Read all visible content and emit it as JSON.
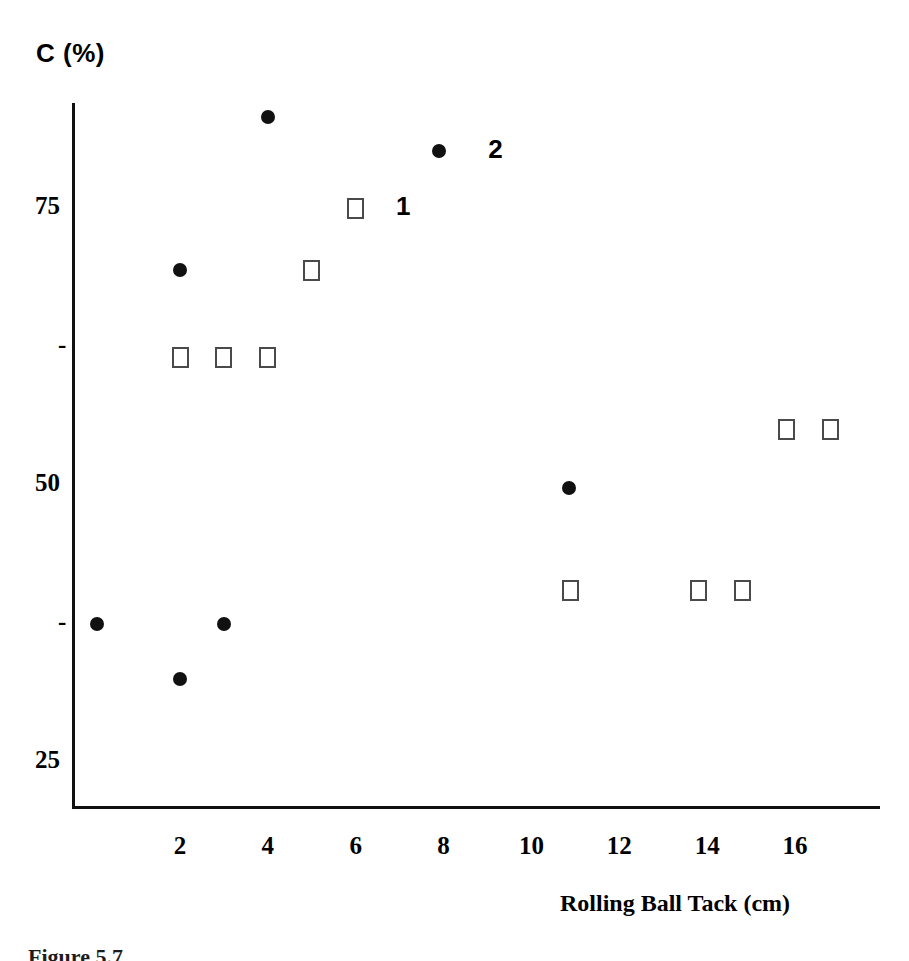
{
  "chart_data": {
    "type": "scatter",
    "title": "",
    "xlabel": "Rolling Ball Tack (cm)",
    "ylabel": "C (%)",
    "xlim": [
      0,
      18.4
    ],
    "ylim": [
      22.5,
      86
    ],
    "grid": false,
    "legend_position": "inline-annotation",
    "xticks": [
      2,
      4,
      6,
      8,
      10,
      12,
      14,
      16
    ],
    "xtick_labels": [
      "2",
      "4",
      "6",
      "8",
      "10",
      "12",
      "14",
      "16"
    ],
    "yticks": [
      75,
      62.5,
      50,
      37.5,
      25
    ],
    "ytick_labels": [
      "75",
      "-",
      "50",
      "-",
      "25"
    ],
    "annotations": [
      {
        "text": "1",
        "x": 7.1,
        "y": 75.0,
        "series": "Series 1"
      },
      {
        "text": "2",
        "x": 9.2,
        "y": 80.1,
        "series": "Series 2"
      }
    ],
    "series": [
      {
        "name": "Series 1",
        "label": "1",
        "marker": "open-square",
        "color": "#4a4a4a",
        "points": [
          {
            "x": 2.0,
            "y": 61.5
          },
          {
            "x": 3.0,
            "y": 61.5
          },
          {
            "x": 4.0,
            "y": 61.5
          },
          {
            "x": 5.0,
            "y": 69.4
          },
          {
            "x": 6.0,
            "y": 75.0
          },
          {
            "x": 10.9,
            "y": 40.5
          },
          {
            "x": 13.8,
            "y": 40.5
          },
          {
            "x": 14.8,
            "y": 40.5
          },
          {
            "x": 15.8,
            "y": 55.0
          },
          {
            "x": 16.8,
            "y": 55.0
          }
        ]
      },
      {
        "name": "Series 2",
        "label": "2",
        "marker": "filled-circle",
        "color": "#111111",
        "points": [
          {
            "x": 0.1,
            "y": 37.5
          },
          {
            "x": 2.0,
            "y": 32.5
          },
          {
            "x": 2.0,
            "y": 69.4
          },
          {
            "x": 3.0,
            "y": 37.5
          },
          {
            "x": 4.0,
            "y": 83.2
          },
          {
            "x": 7.9,
            "y": 80.1
          },
          {
            "x": 10.85,
            "y": 49.7
          }
        ]
      }
    ]
  },
  "axes": {
    "y_title": "C (%)",
    "x_title": "Rolling Ball Tack (cm)",
    "y_labels": [
      {
        "text": "75",
        "value": 75
      },
      {
        "text": "-",
        "value": 62.5
      },
      {
        "text": "50",
        "value": 50
      },
      {
        "text": "-",
        "value": 37.5
      },
      {
        "text": "25",
        "value": 25
      }
    ],
    "x_labels": [
      "2",
      "4",
      "6",
      "8",
      "10",
      "12",
      "14",
      "16"
    ]
  },
  "caption": {
    "text": "Figure 5.7"
  }
}
